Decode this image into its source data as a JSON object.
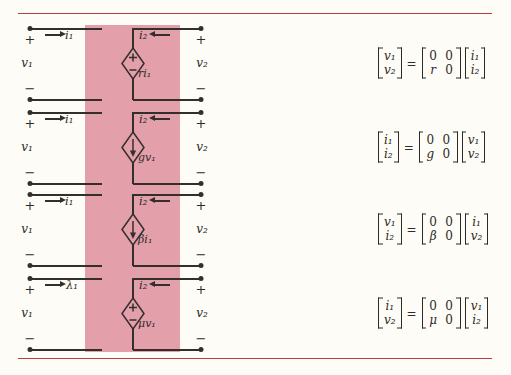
{
  "colors": {
    "paper": "#fdfcf6",
    "band": "#e3a0ab",
    "rule": "#b73c47",
    "ink": "#332f2d",
    "text": "#2e2a28"
  },
  "signs": {
    "plus": "+",
    "minus": "−",
    "equals": "="
  },
  "circuits": [
    {
      "left_current": "i₁",
      "right_current": "i₂",
      "left_voltage": "v₁",
      "right_voltage": "v₂",
      "source_label": "ri₁",
      "source_kind": "dependent-voltage-source"
    },
    {
      "left_current": "i₁",
      "right_current": "i₂",
      "left_voltage": "v₁",
      "right_voltage": "v₂",
      "source_label": "gv₁",
      "source_kind": "dependent-current-source"
    },
    {
      "left_current": "i₁",
      "right_current": "i₂",
      "left_voltage": "v₁",
      "right_voltage": "v₂",
      "source_label": "βi₁",
      "source_kind": "dependent-current-source"
    },
    {
      "left_current": "λ₁",
      "right_current": "i₂",
      "left_voltage": "v₁",
      "right_voltage": "v₂",
      "source_label": "μv₁",
      "source_kind": "dependent-voltage-source"
    }
  ],
  "equations": [
    {
      "lhs": [
        "v₁",
        "v₂"
      ],
      "matrix": [
        [
          "0",
          "0"
        ],
        [
          "r",
          "0"
        ]
      ],
      "rhs": [
        "i₁",
        "i₂"
      ]
    },
    {
      "lhs": [
        "i₁",
        "i₂"
      ],
      "matrix": [
        [
          "0",
          "0"
        ],
        [
          "g",
          "0"
        ]
      ],
      "rhs": [
        "v₁",
        "v₂"
      ]
    },
    {
      "lhs": [
        "v₁",
        "i₂"
      ],
      "matrix": [
        [
          "0",
          "0"
        ],
        [
          "β",
          "0"
        ]
      ],
      "rhs": [
        "i₁",
        "v₂"
      ]
    },
    {
      "lhs": [
        "i₁",
        "v₂"
      ],
      "matrix": [
        [
          "0",
          "0"
        ],
        [
          "μ",
          "0"
        ]
      ],
      "rhs": [
        "v₁",
        "i₂"
      ]
    }
  ]
}
